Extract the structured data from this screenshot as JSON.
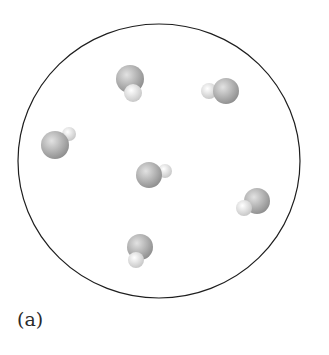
{
  "figure": {
    "label": "(a)",
    "container": {
      "shape": "circle",
      "cx": 159,
      "cy": 161,
      "rx": 141,
      "ry": 137,
      "stroke": "#1e1e1e"
    },
    "colors": {
      "oxygen_light": "#e2e2e2",
      "oxygen_dark": "#8c8c8c",
      "hydrogen_light": "#ffffff",
      "hydrogen_dark": "#c4c4c4"
    },
    "molecules": [
      {
        "id": "molecule-1",
        "oxygen": {
          "cx": 130,
          "cy": 79,
          "r": 14
        },
        "hydrogen": {
          "cx": 133,
          "cy": 93,
          "r": 9
        }
      },
      {
        "id": "molecule-2",
        "oxygen": {
          "cx": 226,
          "cy": 91,
          "r": 13
        },
        "hydrogen": {
          "cx": 209,
          "cy": 91,
          "r": 8
        }
      },
      {
        "id": "molecule-3",
        "oxygen": {
          "cx": 55,
          "cy": 145,
          "r": 14
        },
        "hydrogen": {
          "cx": 69,
          "cy": 134,
          "r": 7
        }
      },
      {
        "id": "molecule-4",
        "oxygen": {
          "cx": 149,
          "cy": 175,
          "r": 13
        },
        "hydrogen": {
          "cx": 165,
          "cy": 171,
          "r": 7
        }
      },
      {
        "id": "molecule-5",
        "oxygen": {
          "cx": 257,
          "cy": 201,
          "r": 13
        },
        "hydrogen": {
          "cx": 244,
          "cy": 208,
          "r": 8
        }
      },
      {
        "id": "molecule-6",
        "oxygen": {
          "cx": 140,
          "cy": 247,
          "r": 13
        },
        "hydrogen": {
          "cx": 136,
          "cy": 260,
          "r": 8
        }
      }
    ]
  }
}
